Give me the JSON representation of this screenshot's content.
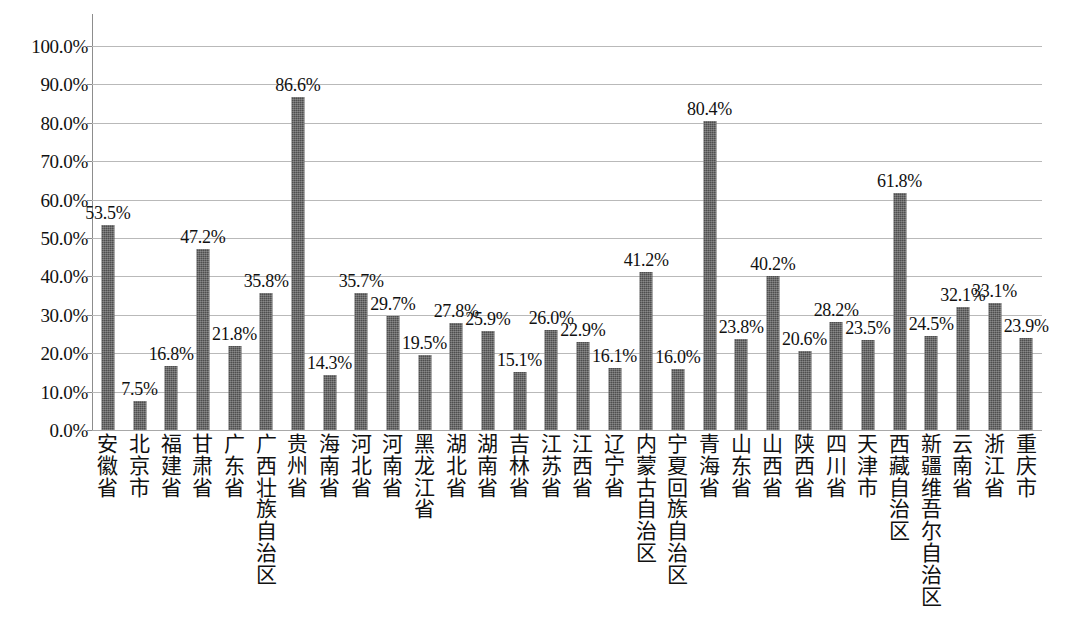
{
  "chart_data": {
    "type": "bar",
    "title": "",
    "subtitle": "",
    "xlabel": "",
    "ylabel": "",
    "ylim": [
      0,
      100
    ],
    "ytick_labels": [
      "100.0%",
      "90.0%",
      "80.0%",
      "70.0%",
      "60.0%",
      "50.0%",
      "40.0%",
      "30.0%",
      "20.0%",
      "10.0%",
      "0.0%"
    ],
    "ytick_values": [
      100,
      90,
      80,
      70,
      60,
      50,
      40,
      30,
      20,
      10,
      0
    ],
    "grid": true,
    "legend": false,
    "legend_position": "none",
    "bar_color": "#4e4e4e",
    "gridline_color": "#b9b9b9",
    "axis_color": "#8d8d8d",
    "categories": [
      "安徽省",
      "北京市",
      "福建省",
      "甘肃省",
      "广东省",
      "广西壮族自治区",
      "贵州省",
      "海南省",
      "河北省",
      "河南省",
      "黑龙江省",
      "湖北省",
      "湖南省",
      "吉林省",
      "江苏省",
      "江西省",
      "辽宁省",
      "内蒙古自治区",
      "宁夏回族自治区",
      "青海省",
      "山东省",
      "山西省",
      "陕西省",
      "四川省",
      "天津市",
      "西藏自治区",
      "新疆维吾尔自治区",
      "云南省",
      "浙江省",
      "重庆市"
    ],
    "values": [
      53.5,
      7.5,
      16.8,
      47.2,
      21.8,
      35.8,
      86.6,
      14.3,
      35.7,
      29.7,
      19.5,
      27.8,
      25.9,
      15.1,
      26.0,
      22.9,
      16.1,
      41.2,
      16.0,
      80.4,
      23.8,
      40.2,
      20.6,
      28.2,
      23.5,
      61.8,
      24.5,
      32.1,
      33.1,
      23.9
    ],
    "data_labels": [
      "53.5%",
      "7.5%",
      "16.8%",
      "47.2%",
      "21.8%",
      "35.8%",
      "86.6%",
      "14.3%",
      "35.7%",
      "29.7%",
      "19.5%",
      "27.8%",
      "25.9%",
      "15.1%",
      "26.0%",
      "22.9%",
      "16.1%",
      "41.2%",
      "16.0%",
      "80.4%",
      "23.8%",
      "40.2%",
      "20.6%",
      "28.2%",
      "23.5%",
      "61.8%",
      "24.5%",
      "32.1%",
      "33.1%",
      "23.9%"
    ]
  }
}
